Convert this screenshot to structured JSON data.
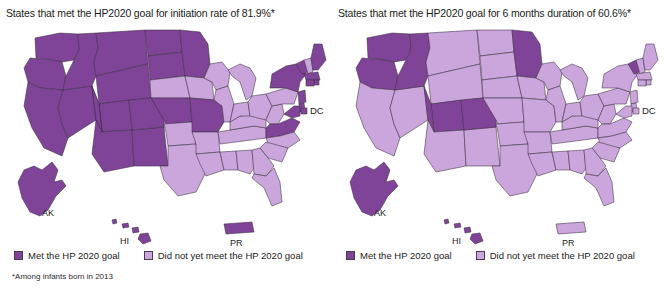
{
  "figure": {
    "background": "#ffffff",
    "colors": {
      "met": "#7F4498",
      "not_met": "#CBA6DC",
      "border": "#3a2d3f",
      "text": "#1b1b1b"
    }
  },
  "panels": [
    {
      "id": "initiation",
      "title": "States that met the HP2020 goal for initiation rate of 81.9%*",
      "footnote": "*Among infants born in 2013",
      "dc_label": "DC",
      "dc_status": "met",
      "insets": [
        {
          "code": "AK",
          "status": "met"
        },
        {
          "code": "HI",
          "status": "met"
        },
        {
          "code": "PR",
          "status": "met"
        }
      ],
      "legend": [
        {
          "key": "met",
          "label": "Met the HP 2020 goal",
          "color": "#7F4498"
        },
        {
          "key": "not_met",
          "label": "Did not yet meet the HP 2020 goal",
          "color": "#CBA6DC"
        }
      ],
      "states": {
        "WA": "met",
        "OR": "met",
        "CA": "met",
        "NV": "met",
        "ID": "met",
        "MT": "met",
        "WY": "met",
        "UT": "met",
        "AZ": "met",
        "NM": "met",
        "CO": "met",
        "ND": "met",
        "SD": "met",
        "NE": "not_met",
        "KS": "met",
        "OK": "not_met",
        "TX": "not_met",
        "MN": "met",
        "IA": "not_met",
        "MO": "met",
        "AR": "not_met",
        "LA": "not_met",
        "WI": "not_met",
        "IL": "not_met",
        "MS": "not_met",
        "AL": "not_met",
        "TN": "not_met",
        "KY": "not_met",
        "IN": "not_met",
        "MI": "not_met",
        "OH": "not_met",
        "WV": "not_met",
        "VA": "met",
        "NC": "not_met",
        "SC": "not_met",
        "GA": "not_met",
        "FL": "not_met",
        "PA": "not_met",
        "NY": "met",
        "VT": "met",
        "NH": "not_met",
        "ME": "met",
        "MA": "met",
        "RI": "met",
        "CT": "met",
        "NJ": "met",
        "DE": "met",
        "MD": "met"
      }
    },
    {
      "id": "duration",
      "title": "States that met the HP2020 goal for 6 months duration of 60.6%*",
      "footnote": "",
      "dc_label": "DC",
      "dc_status": "not_met",
      "insets": [
        {
          "code": "AK",
          "status": "met"
        },
        {
          "code": "HI",
          "status": "met"
        },
        {
          "code": "PR",
          "status": "not_met"
        }
      ],
      "legend": [
        {
          "key": "met",
          "label": "Met the HP 2020 goal",
          "color": "#7F4498"
        },
        {
          "key": "not_met",
          "label": "Did not yet meet the HP 2020 goal",
          "color": "#CBA6DC"
        }
      ],
      "states": {
        "WA": "met",
        "OR": "met",
        "CA": "not_met",
        "NV": "not_met",
        "ID": "met",
        "MT": "not_met",
        "WY": "not_met",
        "UT": "met",
        "AZ": "not_met",
        "NM": "not_met",
        "CO": "met",
        "ND": "not_met",
        "SD": "not_met",
        "NE": "not_met",
        "KS": "not_met",
        "OK": "not_met",
        "TX": "not_met",
        "MN": "met",
        "IA": "not_met",
        "MO": "not_met",
        "AR": "not_met",
        "LA": "not_met",
        "WI": "not_met",
        "IL": "not_met",
        "MS": "not_met",
        "AL": "not_met",
        "TN": "not_met",
        "KY": "not_met",
        "IN": "not_met",
        "MI": "not_met",
        "OH": "not_met",
        "WV": "not_met",
        "VA": "not_met",
        "NC": "not_met",
        "SC": "not_met",
        "GA": "not_met",
        "FL": "not_met",
        "PA": "not_met",
        "NY": "not_met",
        "VT": "met",
        "NH": "not_met",
        "ME": "not_met",
        "MA": "not_met",
        "RI": "not_met",
        "CT": "not_met",
        "NJ": "not_met",
        "DE": "not_met",
        "MD": "not_met"
      }
    }
  ]
}
